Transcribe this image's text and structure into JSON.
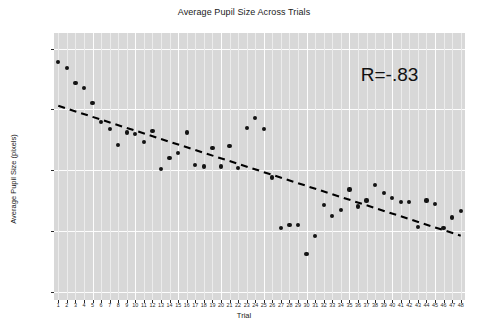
{
  "chart_data": {
    "type": "scatter",
    "title": "Average Pupil Size Across Trials",
    "xlabel": "Trial",
    "ylabel": "Average Pupil Size (pixels)",
    "xlim": [
      0.5,
      48.5
    ],
    "ylim": [
      15.93,
      18.13
    ],
    "grid": true,
    "legend": false,
    "panel_background": "#d8d8d8",
    "gridline_color": "#ffffff",
    "point_color": "#141414",
    "trendline_color": "#000000",
    "trendline_style": "dashed",
    "y_ticks": [
      16.0,
      16.5,
      17.0,
      17.5,
      18.0
    ],
    "y_tick_labels": [
      "16.0",
      "16.5",
      "17.0",
      "17.5",
      "18.0"
    ],
    "x_ticks": [
      1,
      2,
      3,
      4,
      5,
      6,
      7,
      8,
      9,
      10,
      11,
      12,
      13,
      14,
      15,
      16,
      17,
      18,
      19,
      20,
      21,
      22,
      23,
      24,
      25,
      26,
      27,
      28,
      29,
      30,
      31,
      32,
      33,
      34,
      35,
      36,
      37,
      38,
      39,
      40,
      41,
      42,
      43,
      44,
      45,
      46,
      47,
      48
    ],
    "x_tick_labels": [
      "1",
      "2",
      "3",
      "4",
      "5",
      "6",
      "7",
      "8",
      "9",
      "10",
      "11",
      "12",
      "13",
      "14",
      "15",
      "16",
      "17",
      "18",
      "19",
      "20",
      "21",
      "22",
      "23",
      "24",
      "25",
      "26",
      "27",
      "28",
      "29",
      "30",
      "31",
      "32",
      "33",
      "34",
      "35",
      "36",
      "37",
      "38",
      "39",
      "40",
      "41",
      "42",
      "43",
      "44",
      "45",
      "46",
      "47",
      "48"
    ],
    "x": [
      1,
      2,
      3,
      4,
      5,
      6,
      7,
      8,
      9,
      10,
      11,
      12,
      13,
      14,
      15,
      16,
      17,
      18,
      19,
      20,
      21,
      22,
      23,
      24,
      25,
      26,
      27,
      28,
      29,
      30,
      31,
      32,
      33,
      34,
      35,
      36,
      37,
      38,
      39,
      40,
      41,
      42,
      43,
      44,
      45,
      46,
      47,
      48
    ],
    "y": [
      17.89,
      17.84,
      17.72,
      17.68,
      17.55,
      17.4,
      17.34,
      17.21,
      17.31,
      17.3,
      17.23,
      17.32,
      17.01,
      17.1,
      17.14,
      17.31,
      17.04,
      17.03,
      17.18,
      17.03,
      17.2,
      17.02,
      17.35,
      17.43,
      17.34,
      16.94,
      16.52,
      16.55,
      16.55,
      16.31,
      16.46,
      16.71,
      16.62,
      16.67,
      16.84,
      16.7,
      16.75,
      16.88,
      16.81,
      16.77,
      16.74,
      16.74,
      16.53,
      16.75,
      16.72,
      16.52,
      16.61,
      16.66
    ],
    "trendline": {
      "x_start": 1,
      "y_start": 17.53,
      "x_end": 48,
      "y_end": 16.46
    },
    "annotations": [
      {
        "text": "R=-.83",
        "x": 41.0,
        "y": 17.77
      }
    ]
  }
}
